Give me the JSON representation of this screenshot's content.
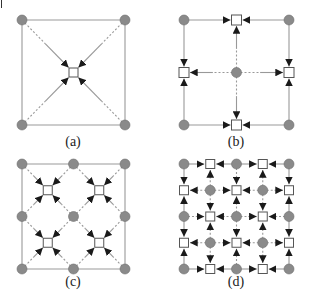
{
  "figure": {
    "panels": [
      {
        "id": "a",
        "label": "(a)",
        "grid": 1,
        "pattern": "diagonal-to-center"
      },
      {
        "id": "b",
        "label": "(b)",
        "grid": 1,
        "pattern": "axis-to-edge-midpoints"
      },
      {
        "id": "c",
        "label": "(c)",
        "grid": 2,
        "pattern": "diagonal-to-cell-centers"
      },
      {
        "id": "d",
        "label": "(d)",
        "grid": 2,
        "pattern": "axis-to-edge-midpoints"
      }
    ],
    "legend_semantics": {
      "circle": "gray filled node",
      "square": "white square node"
    },
    "colors": {
      "circle_fill": "#8a8a8a",
      "circle_stroke": "#6e6e6e",
      "line": "#999999",
      "arrow": "#1a1a1a",
      "square_stroke": "#555555"
    }
  }
}
